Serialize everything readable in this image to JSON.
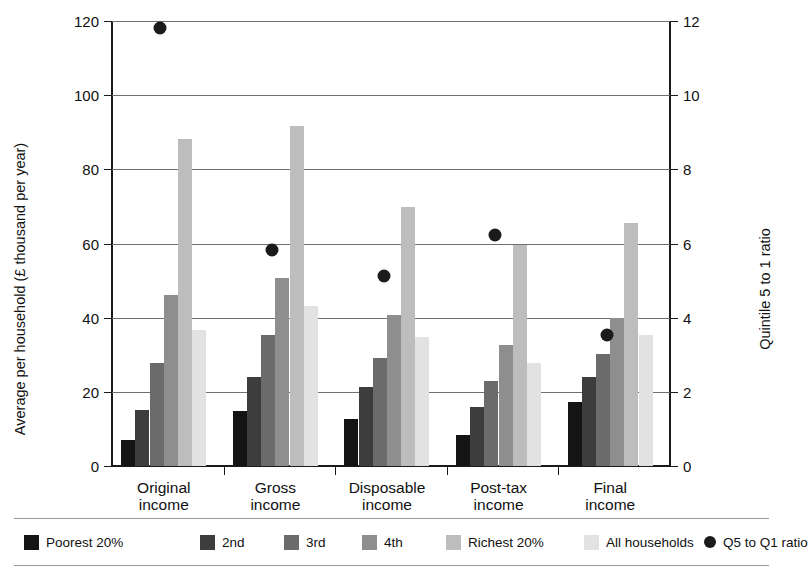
{
  "chart_data": {
    "type": "bar",
    "title": "",
    "subtitle": "",
    "xlabel": "",
    "ylabel": "Average per household (£ thousand per year)",
    "y2label": "Quintile 5 to 1 ratio",
    "categories": [
      "Original\nincome",
      "Gross\nincome",
      "Disposable\nincome",
      "Post-tax\nincome",
      "Final\nincome"
    ],
    "category_labels": [
      {
        "line1": "Original",
        "line2": "income"
      },
      {
        "line1": "Gross",
        "line2": "income"
      },
      {
        "line1": "Disposable",
        "line2": "income"
      },
      {
        "line1": "Post-tax",
        "line2": "income"
      },
      {
        "line1": "Final",
        "line2": "income"
      }
    ],
    "ylim": [
      0,
      120
    ],
    "yticks": [
      0,
      20,
      40,
      60,
      80,
      100,
      120
    ],
    "y2lim": [
      0,
      12
    ],
    "y2ticks": [
      0,
      2,
      4,
      6,
      8,
      10,
      12
    ],
    "grid": true,
    "legend_position": "bottom",
    "series": [
      {
        "name": "Poorest 20%",
        "color": "#141414",
        "values": [
          7.0,
          14.8,
          12.8,
          8.4,
          17.3
        ]
      },
      {
        "name": "2nd",
        "color": "#3d3d3d",
        "values": [
          15.1,
          24.1,
          21.2,
          15.9,
          24.1
        ]
      },
      {
        "name": "3rd",
        "color": "#6b6b6b",
        "values": [
          27.7,
          35.2,
          29.2,
          23.0,
          30.2
        ]
      },
      {
        "name": "4th",
        "color": "#8e8e8e",
        "values": [
          46.0,
          50.6,
          40.8,
          32.6,
          39.9
        ]
      },
      {
        "name": "Richest 20%",
        "color": "#bdbdbd",
        "values": [
          88.2,
          91.8,
          69.8,
          59.6,
          65.5
        ]
      },
      {
        "name": "All households",
        "color": "#e2e2e2",
        "values": [
          36.8,
          43.2,
          34.7,
          27.9,
          35.4
        ]
      }
    ],
    "ratio_series": {
      "name": "Q5 to Q1 ratio",
      "color": "#1b1b1b",
      "marker": "circle",
      "axis": "right",
      "values": [
        12.0,
        6.0,
        5.3,
        6.4,
        3.7
      ]
    }
  },
  "legend": {
    "items": [
      {
        "label": "Poorest 20%",
        "swatch": "#141414",
        "type": "swatch"
      },
      {
        "label": "2nd",
        "swatch": "#3d3d3d",
        "type": "swatch"
      },
      {
        "label": "3rd",
        "swatch": "#6b6b6b",
        "type": "swatch"
      },
      {
        "label": "4th",
        "swatch": "#8e8e8e",
        "type": "swatch"
      },
      {
        "label": "Richest 20%",
        "swatch": "#bdbdbd",
        "type": "swatch"
      },
      {
        "label": "All households",
        "swatch": "#e2e2e2",
        "type": "swatch"
      },
      {
        "label": "Q5 to Q1 ratio",
        "swatch": "#1b1b1b",
        "type": "dot"
      }
    ]
  },
  "colors": {
    "axis": "#1a1a1a",
    "grid": "#6f6f6f",
    "background": "#ffffff",
    "text": "#111111"
  }
}
